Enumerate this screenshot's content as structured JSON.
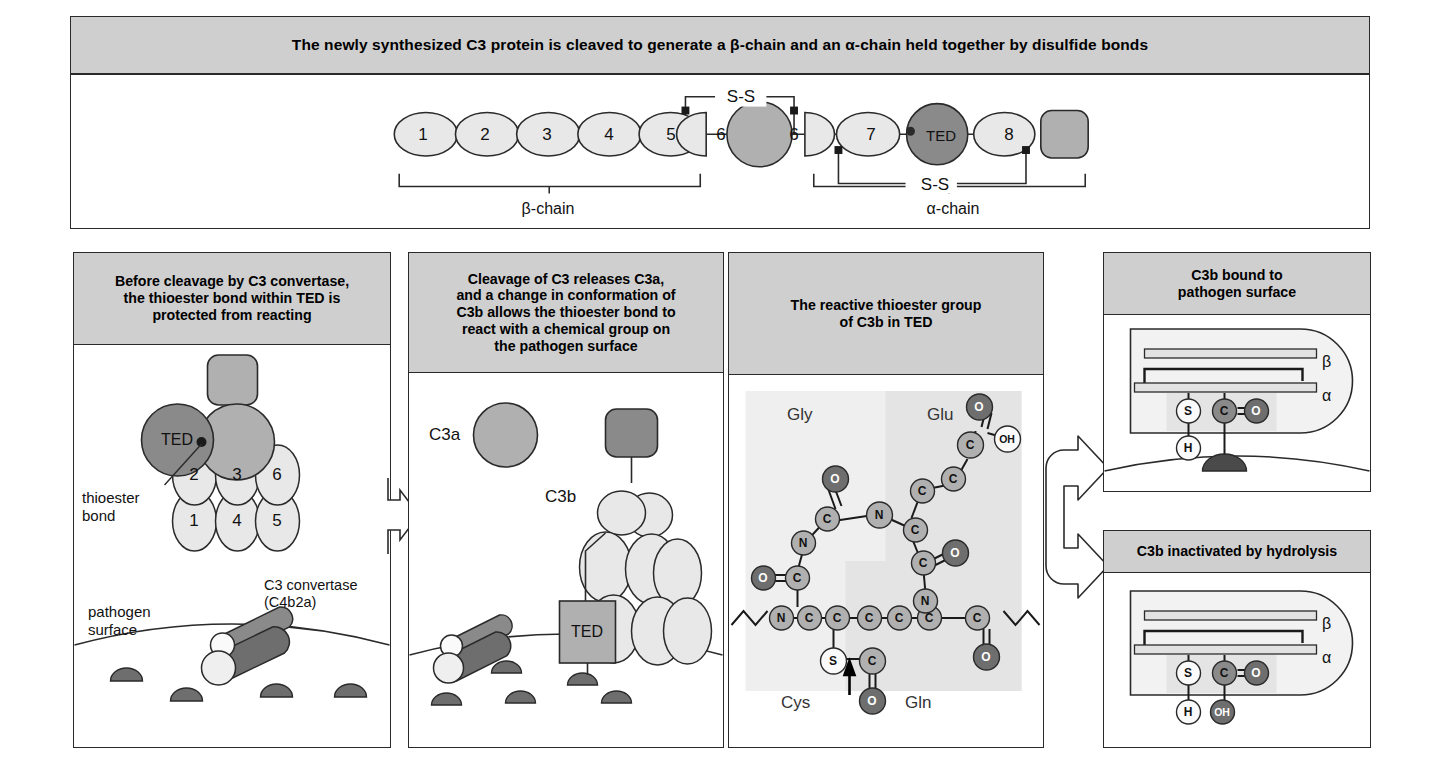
{
  "top_banner": {
    "title": "The newly synthesized C3 protein is cleaved to generate a β-chain and an α-chain held together by disulfide bonds"
  },
  "chain_diagram": {
    "domains_beta": [
      "1",
      "2",
      "3",
      "4",
      "5",
      "6"
    ],
    "alpha_first_half_domain": "6",
    "domains_alpha": [
      "7",
      "TED",
      "8"
    ],
    "disulfide_top_label": "S-S",
    "disulfide_bottom_label": "S-S",
    "bracket_beta_label": "β-chain",
    "bracket_alpha_label": "α-chain"
  },
  "panels": {
    "p1": {
      "header": "Before cleavage by C3 convertase,\nthe thioester bond within TED is\nprotected from reacting",
      "ted_label": "TED",
      "thioester_label": "thioester\nbond",
      "convertase_label": "C3 convertase\n(C4b2a)",
      "surface_label": "pathogen\nsurface",
      "domain_top_row": [
        "2",
        "3",
        "6"
      ],
      "domain_bottom_row": [
        "1",
        "4",
        "5"
      ]
    },
    "p2": {
      "header": "Cleavage of C3 releases C3a,\nand a change in conformation of\nC3b allows the thioester bond to\nreact with a chemical group on\nthe pathogen surface",
      "c3a_label": "C3a",
      "c3b_label": "C3b",
      "ted_label": "TED"
    },
    "p3": {
      "header": "The reactive thioester group\nof C3b in TED",
      "residues": [
        "Gly",
        "Glu",
        "Cys",
        "Gln"
      ],
      "atoms": {
        "carbon": "C",
        "nitrogen": "N",
        "oxygen": "O",
        "sulfur": "S",
        "hydroxyl": "OH"
      }
    },
    "p4": {
      "header": "C3b bound to\npathogen surface",
      "beta_label": "β",
      "alpha_label": "α",
      "atom_s": "S",
      "atom_c": "C",
      "atom_o": "O",
      "atom_h": "H"
    },
    "p5": {
      "header": "C3b inactivated by hydrolysis",
      "beta_label": "β",
      "alpha_label": "α",
      "atom_s": "S",
      "atom_c": "C",
      "atom_o": "O",
      "atom_h": "H",
      "atom_oh": "OH"
    }
  },
  "colors": {
    "header_gray": "#cfcfcf",
    "mid_gray": "#b0b0b0",
    "dark_gray": "#8a8a8a",
    "darkest_gray": "#6e6e6e",
    "light_fill": "#e8e8e8",
    "panel_tint": "#ececec",
    "stroke": "#2a2a2a"
  }
}
